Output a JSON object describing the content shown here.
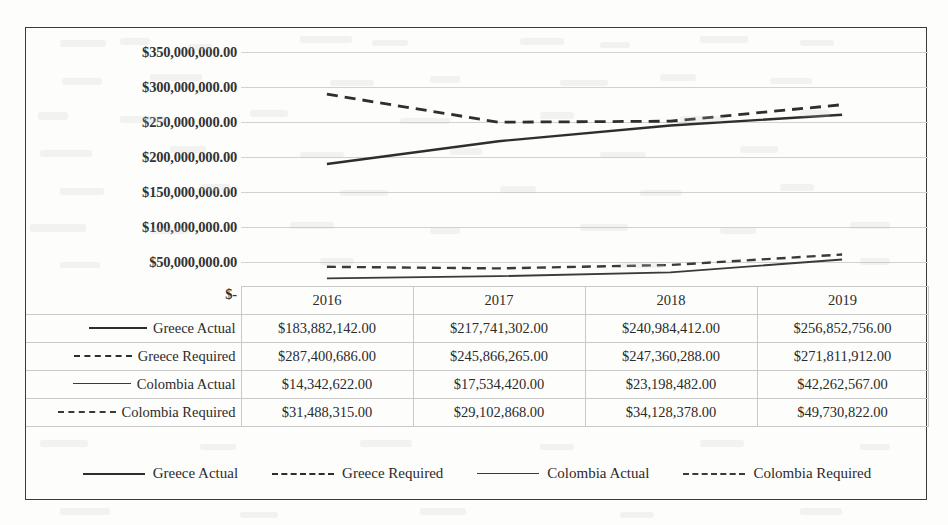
{
  "chart_data": {
    "type": "line",
    "title": "",
    "xlabel": "",
    "ylabel": "",
    "categories": [
      "2016",
      "2017",
      "2018",
      "2019"
    ],
    "ylim": [
      0,
      350000000
    ],
    "ytick_values": [
      350000000,
      300000000,
      250000000,
      200000000,
      150000000,
      100000000,
      50000000,
      0
    ],
    "ytick_labels": [
      "$350,000,000.00",
      "$300,000,000.00",
      "$250,000,000.00",
      "$200,000,000.00",
      "$150,000,000.00",
      "$100,000,000.00",
      "$50,000,000.00",
      "$-"
    ],
    "grid": true,
    "legend_position": "bottom",
    "series": [
      {
        "name": "Greece Actual",
        "style": "solid-thick",
        "color": "#2e2e2e",
        "values": [
          183882142,
          217741302,
          240984412,
          256852756
        ],
        "labels": [
          "$183,882,142.00",
          "$217,741,302.00",
          "$240,984,412.00",
          "$256,852,756.00"
        ]
      },
      {
        "name": "Greece Required",
        "style": "dashed-thick",
        "color": "#2e2e2e",
        "values": [
          287400686,
          245866265,
          247360288,
          271811912
        ],
        "labels": [
          "$287,400,686.00",
          "$245,866,265.00",
          "$247,360,288.00",
          "$271,811,912.00"
        ]
      },
      {
        "name": "Colombia Actual",
        "style": "solid-thin",
        "color": "#3a3a3a",
        "values": [
          14342622,
          17534420,
          23198482,
          42262567
        ],
        "labels": [
          "$14,342,622.00",
          "$17,534,420.00",
          "$23,198,482.00",
          "$42,262,567.00"
        ]
      },
      {
        "name": "Colombia Required",
        "style": "dashed-thin",
        "color": "#3a3a3a",
        "values": [
          31488315,
          29102868,
          34128378,
          49730822
        ],
        "labels": [
          "$31,488,315.00",
          "$29,102,868.00",
          "$34,128,378.00",
          "$49,730,822.00"
        ]
      }
    ]
  },
  "table": {
    "corner_label": "",
    "column_headers": [
      "2016",
      "2017",
      "2018",
      "2019"
    ],
    "rows": [
      {
        "label": "Greece Actual",
        "style": "solid-thick",
        "values": [
          "$183,882,142.00",
          "$217,741,302.00",
          "$240,984,412.00",
          "$256,852,756.00"
        ]
      },
      {
        "label": "Greece Required",
        "style": "dashed-thick",
        "values": [
          "$287,400,686.00",
          "$245,866,265.00",
          "$247,360,288.00",
          "$271,811,912.00"
        ]
      },
      {
        "label": "Colombia Actual",
        "style": "solid-thin",
        "values": [
          "$14,342,622.00",
          "$17,534,420.00",
          "$23,198,482.00",
          "$42,262,567.00"
        ]
      },
      {
        "label": "Colombia Required",
        "style": "dashed-thin",
        "values": [
          "$31,488,315.00",
          "$29,102,868.00",
          "$34,128,378.00",
          "$49,730,822.00"
        ]
      }
    ]
  },
  "legend": {
    "items": [
      {
        "label": "Greece Actual",
        "style": "solid-thick"
      },
      {
        "label": "Greece Required",
        "style": "dashed-thick"
      },
      {
        "label": "Colombia Actual",
        "style": "solid-thin"
      },
      {
        "label": "Colombia Required",
        "style": "dashed-thin"
      }
    ]
  },
  "colors": {
    "frame": "#3a3a3a",
    "gridline": "#d2d2d2",
    "text": "#2b2b2b",
    "background": "#fdfdfc"
  }
}
